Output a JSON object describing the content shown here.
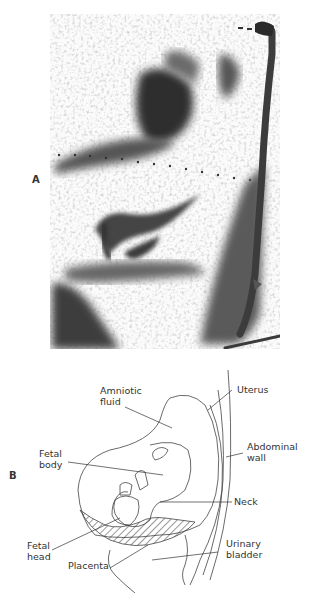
{
  "figure": {
    "panel_a": {
      "letter": "A",
      "description": "Ultrasound scan (grayscale sonogram)"
    },
    "panel_b": {
      "letter": "B",
      "labels": {
        "amniotic_fluid_1": "Amniotic",
        "amniotic_fluid_2": "fluid",
        "uterus": "Uterus",
        "abdominal_wall_1": "Abdominal",
        "abdominal_wall_2": "wall",
        "fetal_body_1": "Fetal",
        "fetal_body_2": "body",
        "neck": "Neck",
        "fetal_head_1": "Fetal",
        "fetal_head_2": "head",
        "placenta": "Placenta",
        "urinary_bladder_1": "Urinary",
        "urinary_bladder_2": "bladder"
      }
    }
  },
  "colors": {
    "ink": "#333333",
    "scan_dark": "#3a3a3a",
    "scan_mid": "#8a8a8a",
    "scan_light": "#d8d8d8"
  }
}
